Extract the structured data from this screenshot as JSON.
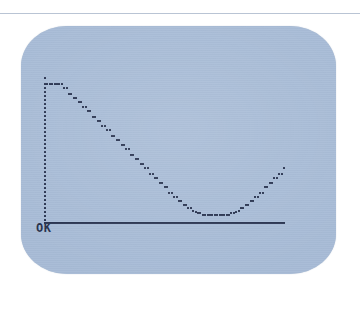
{
  "screen": {
    "background_color": "#a7bbd6",
    "ink_color": "#283350",
    "page_background": "#ffffff",
    "rule_color": "#b9c4d4"
  },
  "terminal": {
    "prompt_text": "OK"
  },
  "chart_data": {
    "type": "scatter",
    "title": "",
    "xlabel": "",
    "ylabel": "",
    "grid": false,
    "legend": null,
    "axis_style": "dotted",
    "xlim": [
      0,
      100
    ],
    "ylim": [
      0,
      100
    ],
    "x": [
      0,
      1,
      2,
      3,
      4,
      5,
      6,
      7,
      8,
      9,
      10,
      11,
      12,
      13,
      14,
      15,
      16,
      17,
      18,
      19,
      20,
      21,
      22,
      23,
      24,
      25,
      26,
      27,
      28,
      29,
      30,
      31,
      32,
      33,
      34,
      35,
      36,
      37,
      38,
      39,
      40,
      41,
      42,
      43,
      44,
      45,
      46,
      47,
      48,
      49,
      50,
      51,
      52,
      53,
      54,
      55,
      56,
      57,
      58,
      59,
      60,
      61,
      62,
      63,
      64,
      65,
      66,
      67,
      68,
      69,
      70,
      71,
      72,
      73,
      74,
      75,
      76,
      77,
      78,
      79,
      80,
      81,
      82,
      83,
      84,
      85,
      86,
      87,
      88,
      89,
      90,
      91,
      92,
      93,
      94,
      95,
      96,
      97,
      98,
      99,
      100
    ],
    "y": [
      100,
      100,
      100,
      100,
      100,
      100,
      100,
      100,
      97,
      97,
      93,
      93,
      90,
      90,
      87,
      87,
      83,
      83,
      80,
      80,
      76,
      76,
      73,
      73,
      69,
      69,
      66,
      66,
      62,
      62,
      59,
      59,
      55,
      55,
      52,
      52,
      48,
      48,
      45,
      45,
      41,
      41,
      38,
      38,
      34,
      34,
      31,
      31,
      27,
      27,
      24,
      24,
      20,
      20,
      17,
      17,
      14,
      14,
      11,
      11,
      9,
      9,
      7,
      6,
      5,
      5,
      4,
      4,
      4,
      4,
      4,
      4,
      4,
      4,
      4,
      4,
      4,
      4,
      5,
      5,
      6,
      7,
      9,
      9,
      11,
      11,
      14,
      14,
      17,
      17,
      20,
      20,
      24,
      24,
      27,
      27,
      31,
      31,
      34,
      34,
      38
    ],
    "series_note": "left branch descends from clipped maximum to minimum plateau near x=62-78, right branch ascends back to clipped maximum",
    "clipped_runs": [
      {
        "side": "left",
        "x_from": 0,
        "x_to": 7,
        "y": 100
      },
      {
        "side": "minimum",
        "x_from": 62,
        "x_to": 78,
        "y": 4
      },
      {
        "side": "right",
        "x_from": 92,
        "x_to": 100,
        "y": 100
      }
    ]
  },
  "axes": {
    "y_axis": {
      "orientation": "vertical",
      "style": "dotted",
      "tick_count": 34
    },
    "x_axis": {
      "orientation": "horizontal",
      "style": "dotted",
      "tick_count": 120
    }
  }
}
